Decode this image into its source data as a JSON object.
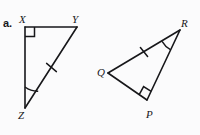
{
  "figure": {
    "problem_label": "a.",
    "background_color": "#fbfbfc",
    "stroke_color": "#17171a",
    "triangles": [
      {
        "name": "triangle-xyz",
        "vertices": [
          {
            "label": "X",
            "x": 25,
            "y": 27
          },
          {
            "label": "Y",
            "x": 77,
            "y": 27
          },
          {
            "label": "Z",
            "x": 25,
            "y": 108
          }
        ],
        "right_angle_at": "X",
        "arc_angle_at": "Z",
        "tick_mark_on_side": "ZY"
      },
      {
        "name": "triangle-qpr",
        "vertices": [
          {
            "label": "Q",
            "x": 108,
            "y": 73
          },
          {
            "label": "R",
            "x": 180,
            "y": 30
          },
          {
            "label": "P",
            "x": 147,
            "y": 100
          }
        ],
        "right_angle_at": "P",
        "arc_angle_at": "R",
        "tick_mark_on_side": "QR"
      }
    ]
  }
}
